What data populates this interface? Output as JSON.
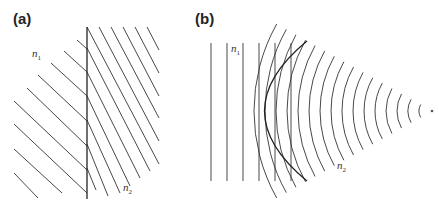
{
  "figure": {
    "panels": [
      {
        "id": "a",
        "label": "(a)",
        "description": "Plane wavefronts refracting at a flat interface",
        "media": [
          {
            "symbol": "n",
            "subscript": "1"
          },
          {
            "symbol": "n",
            "subscript": "2"
          }
        ]
      },
      {
        "id": "b",
        "label": "(b)",
        "description": "Plane wavefronts converted to converging spherical wavefronts by a curved lens surface",
        "media": [
          {
            "symbol": "n",
            "subscript": "1"
          },
          {
            "symbol": "n",
            "subscript": "2"
          }
        ]
      }
    ]
  }
}
